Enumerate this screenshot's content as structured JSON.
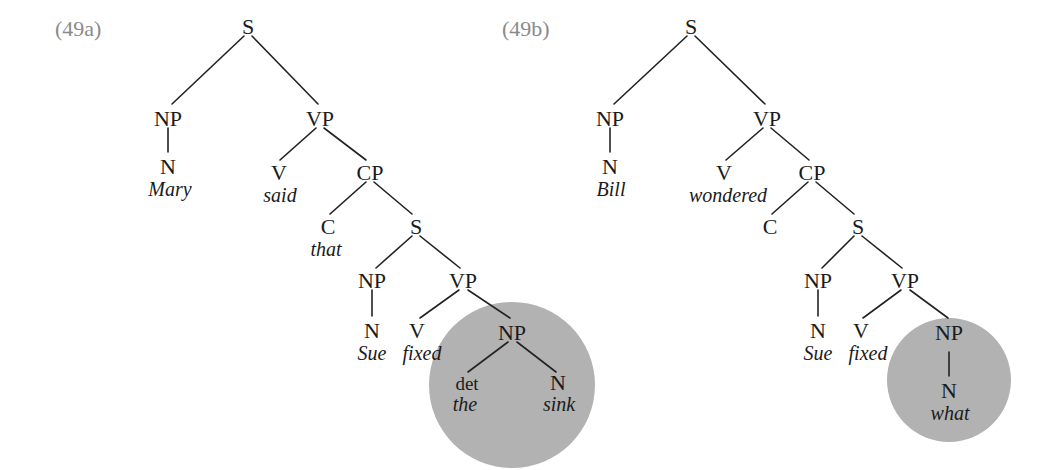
{
  "figure": {
    "type": "syntax-tree-pair",
    "background_color": "#ffffff",
    "line_color": "#222222",
    "text_color": "#1b1b1b",
    "tag_color": "#8a8a8a",
    "highlight_color": "#b2b2b2"
  },
  "trees": [
    {
      "tag": "(49a)",
      "sentence": "Mary said that Sue fixed the sink",
      "highlight": {
        "shape": "circle",
        "cx": 512,
        "cy": 385,
        "r": 83,
        "encircles": "object NP 'the sink'"
      },
      "nodes": {
        "s_root": "S",
        "np_subject": "NP",
        "vp_matrix": "VP",
        "n_subject": "N",
        "n_subject_word": "Mary",
        "v_matrix": "V",
        "v_matrix_word": "said",
        "cp": "CP",
        "c": "C",
        "c_word": "that",
        "s_embedded": "S",
        "np_embedded_subject": "NP",
        "vp_embedded": "VP",
        "n_embedded_subject": "N",
        "n_embedded_subject_word": "Sue",
        "v_embedded": "V",
        "v_embedded_word": "fixed",
        "np_object": "NP",
        "det": "det",
        "det_word": "the",
        "n_object": "N",
        "n_object_word": "sink"
      }
    },
    {
      "tag": "(49b)",
      "sentence": "Bill wondered Sue fixed what",
      "highlight": {
        "shape": "circle",
        "cx": 949,
        "cy": 380,
        "r": 62,
        "encircles": "object NP 'what'"
      },
      "nodes": {
        "s_root": "S",
        "np_subject": "NP",
        "vp_matrix": "VP",
        "n_subject": "N",
        "n_subject_word": "Bill",
        "v_matrix": "V",
        "v_matrix_word": "wondered",
        "cp": "CP",
        "c": "C",
        "c_word": "",
        "s_embedded": "S",
        "np_embedded_subject": "NP",
        "vp_embedded": "VP",
        "n_embedded_subject": "N",
        "n_embedded_subject_word": "Sue",
        "v_embedded": "V",
        "v_embedded_word": "fixed",
        "np_object": "NP",
        "n_object": "N",
        "n_object_word": "what"
      }
    }
  ]
}
